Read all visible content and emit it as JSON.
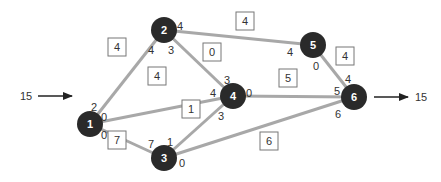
{
  "diagram": {
    "type": "flow-network",
    "colors": {
      "node": "#2a2a2a",
      "edge": "#a8a8a8",
      "text": "#333333",
      "box_border": "#777777"
    },
    "source_flow": {
      "label": "15",
      "x1": 38,
      "x2": 72,
      "y": 96
    },
    "sink_flow": {
      "label": "15",
      "x1": 374,
      "x2": 408,
      "y": 97
    },
    "nodes": [
      {
        "id": "1",
        "label": "1",
        "x": 90,
        "y": 124
      },
      {
        "id": "2",
        "label": "2",
        "x": 164,
        "y": 30
      },
      {
        "id": "3",
        "label": "3",
        "x": 164,
        "y": 158
      },
      {
        "id": "4",
        "label": "4",
        "x": 233,
        "y": 96
      },
      {
        "id": "5",
        "label": "5",
        "x": 313,
        "y": 45
      },
      {
        "id": "6",
        "label": "6",
        "x": 354,
        "y": 97
      }
    ],
    "edges": [
      {
        "from": "1",
        "to": "2",
        "flow": "4",
        "box": {
          "x": 117,
          "y": 47
        }
      },
      {
        "from": "1",
        "to": "4",
        "flow": "4",
        "box": {
          "x": 157,
          "y": 76
        }
      },
      {
        "from": "1",
        "to": "3",
        "flow": "7",
        "box": {
          "x": 117,
          "y": 140
        }
      },
      {
        "from": "2",
        "to": "4",
        "flow": "0",
        "box": {
          "x": 212,
          "y": 52
        }
      },
      {
        "from": "2",
        "to": "5",
        "flow": "4",
        "box": {
          "x": 245,
          "y": 21
        }
      },
      {
        "from": "3",
        "to": "4",
        "flow": "1",
        "box": {
          "x": 191,
          "y": 109
        }
      },
      {
        "from": "3",
        "to": "6",
        "flow": "6",
        "box": {
          "x": 269,
          "y": 141
        }
      },
      {
        "from": "4",
        "to": "6",
        "flow": "5",
        "box": {
          "x": 288,
          "y": 78
        }
      },
      {
        "from": "5",
        "to": "6",
        "flow": "4",
        "box": {
          "x": 345,
          "y": 56
        }
      }
    ],
    "endpoint_labels": [
      {
        "text": "2",
        "x": 94,
        "y": 107
      },
      {
        "text": "0",
        "x": 104,
        "y": 117
      },
      {
        "text": "0",
        "x": 104,
        "y": 135
      },
      {
        "text": "4",
        "x": 151,
        "y": 50
      },
      {
        "text": "3",
        "x": 171,
        "y": 50
      },
      {
        "text": "4",
        "x": 180,
        "y": 26
      },
      {
        "text": "3",
        "x": 227,
        "y": 80
      },
      {
        "text": "4",
        "x": 213,
        "y": 93
      },
      {
        "text": "0",
        "x": 249,
        "y": 93
      },
      {
        "text": "3",
        "x": 221,
        "y": 116
      },
      {
        "text": "7",
        "x": 151,
        "y": 144
      },
      {
        "text": "1",
        "x": 170,
        "y": 142
      },
      {
        "text": "0",
        "x": 182,
        "y": 163
      },
      {
        "text": "4",
        "x": 290,
        "y": 52
      },
      {
        "text": "0",
        "x": 316,
        "y": 66
      },
      {
        "text": "4",
        "x": 348,
        "y": 79
      },
      {
        "text": "5",
        "x": 337,
        "y": 91
      },
      {
        "text": "6",
        "x": 338,
        "y": 114
      }
    ]
  }
}
